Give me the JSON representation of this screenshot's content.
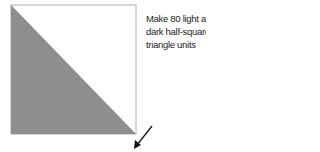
{
  "diagram": {
    "title": "Half-square triangle unit",
    "caption_lines": [
      "Make 80 light and",
      "dark half-square",
      "triangle units"
    ],
    "colors": {
      "dark": "#8e8e8e",
      "light": "#ffffff",
      "outline": "#b0b0b0",
      "arrow": "#111111"
    },
    "square": {
      "x": 11,
      "y": 5,
      "size": 125
    },
    "arrow": {
      "from": [
        152,
        126
      ],
      "to": [
        135,
        147
      ]
    }
  }
}
